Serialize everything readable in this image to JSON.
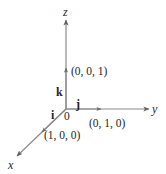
{
  "figure": {
    "type": "3d-coordinate-axes-diagram",
    "background_color": "#ffffff",
    "line_color": "#8a8a8a",
    "text_color": "#262626"
  },
  "axes": [
    {
      "name": "x",
      "label": "x",
      "direction": "down-left"
    },
    {
      "name": "y",
      "label": "y",
      "direction": "right"
    },
    {
      "name": "z",
      "label": "z",
      "direction": "up"
    }
  ],
  "labels": {
    "z_axis": "z",
    "y_axis": "y",
    "x_axis": "x",
    "origin": "0",
    "unit_i": "i",
    "unit_j": "j",
    "unit_k": "k",
    "coord_k": "(0, 0, 1)",
    "coord_j": "(0, 1, 0)",
    "coord_i": "(1, 0, 0)"
  }
}
